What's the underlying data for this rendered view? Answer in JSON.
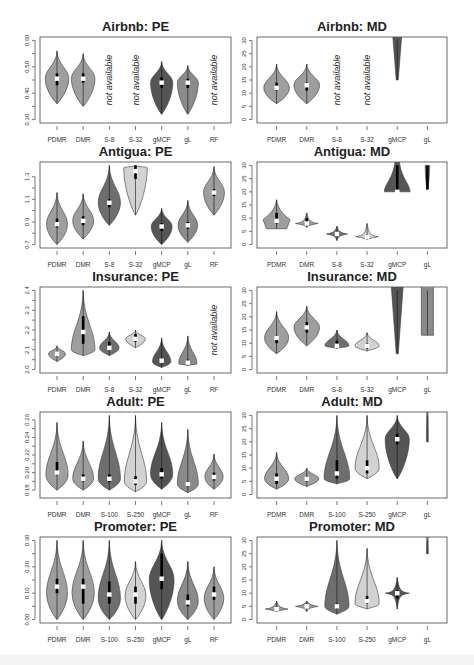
{
  "figure": {
    "layout": {
      "rows": 5,
      "cols": 2
    },
    "colors": {
      "PDMR": "#9e9e9e",
      "DMR": "#9e9e9e",
      "S_small": "#6e6e6e",
      "S_large": "#d2d2d2",
      "gMCP": "#555555",
      "gL": "#8a8a8a",
      "RF": "#9e9e9e",
      "median_marker": "#ffffff",
      "iqr_bar": "#000000"
    },
    "na_text": "not available"
  },
  "chart_data": [
    {
      "type": "violin",
      "title": "Airbnb: PE",
      "ylim": [
        0.3,
        0.6
      ],
      "yticks": [
        "0.30",
        "0.40",
        "0.50",
        "0.60"
      ],
      "categories": [
        "PDMR",
        "DMR",
        "S-8",
        "S-32",
        "gMCP",
        "gL",
        "RF"
      ],
      "series": [
        {
          "name": "PDMR",
          "min": 0.36,
          "q1": 0.43,
          "median": 0.455,
          "q3": 0.475,
          "max": 0.56,
          "peak": 0.455,
          "width": 0.9,
          "color": "PDMR"
        },
        {
          "name": "DMR",
          "min": 0.35,
          "q1": 0.44,
          "median": 0.455,
          "q3": 0.475,
          "max": 0.55,
          "peak": 0.455,
          "width": 0.9,
          "color": "DMR"
        },
        {
          "name": "S-8",
          "na": true
        },
        {
          "name": "S-32",
          "na": true
        },
        {
          "name": "gMCP",
          "min": 0.32,
          "q1": 0.42,
          "median": 0.44,
          "q3": 0.46,
          "max": 0.52,
          "peak": 0.44,
          "width": 0.85,
          "color": "gMCP"
        },
        {
          "name": "gL",
          "min": 0.32,
          "q1": 0.42,
          "median": 0.44,
          "q3": 0.455,
          "max": 0.505,
          "peak": 0.44,
          "width": 0.8,
          "color": "gL"
        },
        {
          "name": "RF",
          "na": true
        }
      ]
    },
    {
      "type": "violin",
      "title": "Airbnb: MD",
      "ylim": [
        0,
        30
      ],
      "yticks": [
        "0",
        "5",
        "10",
        "15",
        "20",
        "25",
        "30"
      ],
      "categories": [
        "PDMR",
        "DMR",
        "S-8",
        "S-32",
        "gMCP",
        "gL"
      ],
      "series": [
        {
          "name": "PDMR",
          "min": 6,
          "q1": 11,
          "median": 12,
          "q3": 14,
          "max": 21,
          "peak": 12,
          "width": 0.85,
          "color": "PDMR"
        },
        {
          "name": "DMR",
          "min": 6,
          "q1": 11,
          "median": 13,
          "q3": 14,
          "max": 21,
          "peak": 13,
          "width": 0.85,
          "color": "DMR"
        },
        {
          "name": "S-8",
          "na": true
        },
        {
          "name": "S-32",
          "na": true
        },
        {
          "name": "gMCP",
          "min": 15,
          "q1": 30,
          "median": 30,
          "q3": 30,
          "max": 30,
          "peak": 30,
          "width": 0.3,
          "color": "gMCP",
          "clipped": true
        },
        {
          "name": "gL",
          "empty": true
        }
      ]
    },
    {
      "type": "violin",
      "title": "Antigua: PE",
      "ylim": [
        0.7,
        1.4
      ],
      "yticks": [
        "0.7",
        "0.9",
        "1.1",
        "1.3"
      ],
      "categories": [
        "PDMR",
        "DMR",
        "S-8",
        "S-32",
        "gMCP",
        "gL",
        "RF"
      ],
      "series": [
        {
          "name": "PDMR",
          "min": 0.7,
          "q1": 0.85,
          "median": 0.88,
          "q3": 0.93,
          "max": 1.16,
          "peak": 0.88,
          "width": 0.8,
          "color": "PDMR"
        },
        {
          "name": "DMR",
          "min": 0.75,
          "q1": 0.87,
          "median": 0.91,
          "q3": 0.95,
          "max": 1.15,
          "peak": 0.91,
          "width": 0.8,
          "color": "DMR"
        },
        {
          "name": "S-8",
          "min": 0.87,
          "q1": 1.03,
          "median": 1.07,
          "q3": 1.1,
          "max": 1.4,
          "peak": 1.07,
          "width": 0.85,
          "color": "S_small"
        },
        {
          "name": "S-32",
          "min": 0.96,
          "q1": 1.28,
          "median": 1.35,
          "q3": 1.4,
          "max": 1.4,
          "peak": 1.38,
          "width": 0.9,
          "color": "S_large",
          "clipped": true
        },
        {
          "name": "gMCP",
          "min": 0.7,
          "q1": 0.82,
          "median": 0.86,
          "q3": 0.89,
          "max": 1.02,
          "peak": 0.86,
          "width": 0.8,
          "color": "gMCP"
        },
        {
          "name": "gL",
          "min": 0.72,
          "q1": 0.84,
          "median": 0.87,
          "q3": 0.9,
          "max": 1.09,
          "peak": 0.87,
          "width": 0.75,
          "color": "gL"
        },
        {
          "name": "RF",
          "min": 0.96,
          "q1": 1.13,
          "median": 1.16,
          "q3": 1.19,
          "max": 1.39,
          "peak": 1.16,
          "width": 0.8,
          "color": "RF"
        }
      ]
    },
    {
      "type": "violin",
      "title": "Antigua: MD",
      "ylim": [
        0,
        30
      ],
      "yticks": [
        "0",
        "5",
        "10",
        "15",
        "20",
        "25",
        "30"
      ],
      "categories": [
        "PDMR",
        "DMR",
        "S-8",
        "S-32",
        "gMCP",
        "gL"
      ],
      "series": [
        {
          "name": "PDMR",
          "min": 6,
          "q1": 8,
          "median": 9,
          "q3": 12,
          "max": 17,
          "peak": 9,
          "width": 0.9,
          "color": "PDMR",
          "shape": "flat"
        },
        {
          "name": "DMR",
          "min": 6.5,
          "q1": 7.5,
          "median": 8,
          "q3": 10,
          "max": 12,
          "peak": 8,
          "width": 0.75,
          "color": "DMR",
          "shape": "spike"
        },
        {
          "name": "S-8",
          "min": 1.5,
          "q1": 3.5,
          "median": 4,
          "q3": 4.5,
          "max": 7,
          "peak": 4,
          "width": 0.7,
          "color": "S_small",
          "shape": "spike"
        },
        {
          "name": "S-32",
          "min": 2,
          "q1": 2.5,
          "median": 3,
          "q3": 4,
          "max": 8,
          "peak": 3,
          "width": 0.75,
          "color": "S_large",
          "shape": "spike"
        },
        {
          "name": "gMCP",
          "min": 20,
          "q1": 20,
          "median": 20,
          "q3": 30,
          "max": 30,
          "peak": 22,
          "width": 0.85,
          "color": "gMCP",
          "shape": "bell-clipped",
          "clipped": true
        },
        {
          "name": "gL",
          "min": 20,
          "q1": 20,
          "median": 20,
          "q3": 30,
          "max": 30,
          "peak": 30,
          "width": 0.15,
          "color": "gL",
          "clipped": true
        }
      ]
    },
    {
      "type": "violin",
      "title": "Insurance: PE",
      "ylim": [
        2.0,
        2.4
      ],
      "yticks": [
        "2.0",
        "2.1",
        "2.2",
        "2.3",
        "2.4"
      ],
      "categories": [
        "PDMR",
        "DMR",
        "S-8",
        "S-32",
        "gMCP",
        "gL",
        "RF"
      ],
      "series": [
        {
          "name": "PDMR",
          "min": 2.04,
          "q1": 2.07,
          "median": 2.08,
          "q3": 2.09,
          "max": 2.12,
          "peak": 2.08,
          "width": 0.65,
          "color": "PDMR"
        },
        {
          "name": "DMR",
          "min": 2.07,
          "q1": 2.13,
          "median": 2.19,
          "q3": 2.27,
          "max": 2.4,
          "peak": 2.1,
          "width": 0.9,
          "color": "DMR"
        },
        {
          "name": "S-8",
          "min": 2.07,
          "q1": 2.1,
          "median": 2.11,
          "q3": 2.14,
          "max": 2.19,
          "peak": 2.11,
          "width": 0.75,
          "color": "S_small"
        },
        {
          "name": "S-32",
          "min": 2.11,
          "q1": 2.14,
          "median": 2.155,
          "q3": 2.18,
          "max": 2.2,
          "peak": 2.155,
          "width": 0.75,
          "color": "S_large"
        },
        {
          "name": "gMCP",
          "min": 2.01,
          "q1": 2.04,
          "median": 2.045,
          "q3": 2.055,
          "max": 2.16,
          "peak": 2.04,
          "width": 0.7,
          "color": "gMCP"
        },
        {
          "name": "gL",
          "min": 2.02,
          "q1": 2.025,
          "median": 2.035,
          "q3": 2.05,
          "max": 2.17,
          "peak": 2.03,
          "width": 0.7,
          "color": "gL"
        },
        {
          "name": "RF",
          "na": true
        }
      ]
    },
    {
      "type": "violin",
      "title": "Insurance: MD",
      "ylim": [
        0,
        30
      ],
      "yticks": [
        "0",
        "5",
        "10",
        "15",
        "20",
        "25",
        "30"
      ],
      "categories": [
        "PDMR",
        "DMR",
        "S-8",
        "S-32",
        "gMCP",
        "gL"
      ],
      "series": [
        {
          "name": "PDMR",
          "min": 6,
          "q1": 10,
          "median": 12,
          "q3": 13,
          "max": 22,
          "peak": 12,
          "width": 0.8,
          "color": "PDMR"
        },
        {
          "name": "DMR",
          "min": 9,
          "q1": 14,
          "median": 16,
          "q3": 18,
          "max": 24,
          "peak": 16,
          "width": 0.85,
          "color": "DMR"
        },
        {
          "name": "S-8",
          "min": 8,
          "q1": 8.5,
          "median": 9,
          "q3": 11,
          "max": 15,
          "peak": 9,
          "width": 0.8,
          "color": "S_small"
        },
        {
          "name": "S-32",
          "min": 7,
          "q1": 8,
          "median": 9,
          "q3": 10,
          "max": 14,
          "peak": 9,
          "width": 0.8,
          "color": "S_large"
        },
        {
          "name": "gMCP",
          "min": 6,
          "q1": 30,
          "median": 30,
          "q3": 30,
          "max": 30,
          "peak": 30,
          "width": 0.4,
          "color": "gMCP",
          "clipped": true
        },
        {
          "name": "gL",
          "min": 13,
          "q1": 30,
          "median": 30,
          "q3": 30,
          "max": 30,
          "peak": 30,
          "width": 0.4,
          "color": "gL",
          "shape": "rect",
          "clipped": true
        }
      ]
    },
    {
      "type": "violin",
      "title": "Adult: PE",
      "ylim": [
        0.175,
        0.265
      ],
      "yticks": [
        "0.18",
        "0.20",
        "0.22",
        "0.24",
        "0.26"
      ],
      "categories": [
        "PDMR",
        "DMR",
        "S-100",
        "S-250",
        "gMCP",
        "gL",
        "RF"
      ],
      "series": [
        {
          "name": "PDMR",
          "min": 0.18,
          "q1": 0.197,
          "median": 0.2,
          "q3": 0.212,
          "max": 0.257,
          "peak": 0.197,
          "width": 0.85,
          "color": "PDMR"
        },
        {
          "name": "DMR",
          "min": 0.18,
          "q1": 0.19,
          "median": 0.193,
          "q3": 0.198,
          "max": 0.236,
          "peak": 0.193,
          "width": 0.8,
          "color": "DMR"
        },
        {
          "name": "S-100",
          "min": 0.18,
          "q1": 0.189,
          "median": 0.193,
          "q3": 0.198,
          "max": 0.265,
          "peak": 0.193,
          "width": 0.85,
          "color": "S_small"
        },
        {
          "name": "S-250",
          "min": 0.178,
          "q1": 0.186,
          "median": 0.19,
          "q3": 0.196,
          "max": 0.265,
          "peak": 0.19,
          "width": 0.85,
          "color": "S_large"
        },
        {
          "name": "gMCP",
          "min": 0.181,
          "q1": 0.193,
          "median": 0.198,
          "q3": 0.205,
          "max": 0.257,
          "peak": 0.198,
          "width": 0.85,
          "color": "gMCP"
        },
        {
          "name": "gL",
          "min": 0.177,
          "q1": 0.184,
          "median": 0.187,
          "q3": 0.19,
          "max": 0.249,
          "peak": 0.187,
          "width": 0.8,
          "color": "gL"
        },
        {
          "name": "RF",
          "min": 0.181,
          "q1": 0.191,
          "median": 0.195,
          "q3": 0.2,
          "max": 0.221,
          "peak": 0.195,
          "width": 0.7,
          "color": "RF"
        }
      ]
    },
    {
      "type": "violin",
      "title": "Adult: MD",
      "ylim": [
        0,
        30
      ],
      "yticks": [
        "0",
        "5",
        "10",
        "15",
        "20",
        "25",
        "30"
      ],
      "categories": [
        "PDMR",
        "DMR",
        "S-100",
        "S-250",
        "gMCP",
        "gL"
      ],
      "series": [
        {
          "name": "PDMR",
          "min": 2,
          "q1": 4,
          "median": 6,
          "q3": 8,
          "max": 16,
          "peak": 6,
          "width": 0.8,
          "color": "PDMR"
        },
        {
          "name": "DMR",
          "min": 3,
          "q1": 5,
          "median": 6,
          "q3": 7,
          "max": 10,
          "peak": 6,
          "width": 0.8,
          "color": "DMR"
        },
        {
          "name": "S-100",
          "min": 4,
          "q1": 6,
          "median": 8,
          "q3": 13,
          "max": 30,
          "peak": 6,
          "width": 0.85,
          "color": "S_small",
          "clipped": true
        },
        {
          "name": "S-250",
          "min": 6,
          "q1": 8,
          "median": 10,
          "q3": 13,
          "max": 30,
          "peak": 10,
          "width": 0.8,
          "color": "S_large",
          "clipped": true
        },
        {
          "name": "gMCP",
          "min": 6,
          "q1": 19,
          "median": 21,
          "q3": 23,
          "max": 30,
          "peak": 21,
          "width": 0.8,
          "color": "gMCP",
          "clipped": true
        },
        {
          "name": "gL",
          "min": 20,
          "q1": 30,
          "median": 30,
          "q3": 30,
          "max": 30,
          "peak": 30,
          "width": 0.04,
          "color": "gL",
          "clipped": true
        }
      ]
    },
    {
      "type": "violin",
      "title": "Promoter: PE",
      "ylim": [
        0.0,
        0.3
      ],
      "yticks": [
        "0.00",
        "0.10",
        "0.20",
        "0.30"
      ],
      "categories": [
        "PDMR",
        "DMR",
        "S-100",
        "S-250",
        "gMCP",
        "gL",
        "RF"
      ],
      "series": [
        {
          "name": "PDMR",
          "min": 0.0,
          "q1": 0.1,
          "median": 0.125,
          "q3": 0.155,
          "max": 0.3,
          "peak": 0.1,
          "width": 0.8,
          "color": "PDMR",
          "clipped": true
        },
        {
          "name": "DMR",
          "min": 0.0,
          "q1": 0.06,
          "median": 0.125,
          "q3": 0.155,
          "max": 0.3,
          "peak": 0.1,
          "width": 0.85,
          "color": "DMR",
          "clipped": true
        },
        {
          "name": "S-100",
          "min": 0.0,
          "q1": 0.06,
          "median": 0.095,
          "q3": 0.145,
          "max": 0.3,
          "peak": 0.08,
          "width": 0.85,
          "color": "S_small",
          "clipped": true
        },
        {
          "name": "S-250",
          "min": 0.0,
          "q1": 0.06,
          "median": 0.095,
          "q3": 0.125,
          "max": 0.22,
          "peak": 0.09,
          "width": 0.8,
          "color": "S_large"
        },
        {
          "name": "gMCP",
          "min": 0.0,
          "q1": 0.115,
          "median": 0.155,
          "q3": 0.25,
          "max": 0.3,
          "peak": 0.15,
          "width": 0.95,
          "color": "gMCP",
          "clipped": true
        },
        {
          "name": "gL",
          "min": 0.0,
          "q1": 0.05,
          "median": 0.065,
          "q3": 0.095,
          "max": 0.22,
          "peak": 0.07,
          "width": 0.8,
          "color": "gL"
        },
        {
          "name": "RF",
          "min": 0.0,
          "q1": 0.075,
          "median": 0.095,
          "q3": 0.125,
          "max": 0.2,
          "peak": 0.08,
          "width": 0.75,
          "color": "RF"
        }
      ]
    },
    {
      "type": "violin",
      "title": "Promoter: MD",
      "ylim": [
        0,
        30
      ],
      "yticks": [
        "0",
        "5",
        "10",
        "15",
        "20",
        "25",
        "30"
      ],
      "categories": [
        "PDMR",
        "DMR",
        "S-100",
        "S-250",
        "gMCP",
        "gL"
      ],
      "series": [
        {
          "name": "PDMR",
          "min": 3,
          "q1": 3.5,
          "median": 4,
          "q3": 5,
          "max": 7,
          "peak": 4,
          "width": 0.75,
          "color": "PDMR",
          "shape": "spike"
        },
        {
          "name": "DMR",
          "min": 3,
          "q1": 4.5,
          "median": 5,
          "q3": 6,
          "max": 7,
          "peak": 5,
          "width": 0.75,
          "color": "DMR",
          "shape": "spike"
        },
        {
          "name": "S-100",
          "min": 2,
          "q1": 4,
          "median": 5,
          "q3": 6,
          "max": 30,
          "peak": 5,
          "width": 0.8,
          "color": "S_small",
          "clipped": true
        },
        {
          "name": "S-250",
          "min": 4,
          "q1": 6,
          "median": 7,
          "q3": 9,
          "max": 27,
          "peak": 6,
          "width": 0.8,
          "color": "S_large"
        },
        {
          "name": "gMCP",
          "min": 4,
          "q1": 8,
          "median": 10,
          "q3": 11,
          "max": 16,
          "peak": 10,
          "width": 0.8,
          "color": "gMCP",
          "shape": "spike"
        },
        {
          "name": "gL",
          "min": 25,
          "q1": 30,
          "median": 30,
          "q3": 30,
          "max": 30,
          "peak": 30,
          "width": 0.04,
          "color": "gL",
          "clipped": true
        }
      ]
    }
  ]
}
